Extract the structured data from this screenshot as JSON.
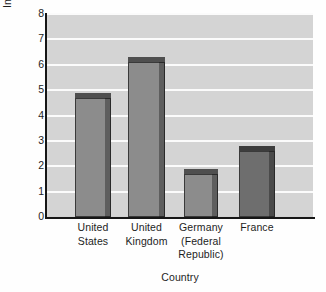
{
  "chart_data": {
    "type": "bar",
    "title": "",
    "xlabel": "Country",
    "ylabel": "Investment Growth Rate (%)",
    "categories": [
      "United States",
      "United Kingdom",
      "Germany (Federal Republic)",
      "France"
    ],
    "category_lines": [
      [
        "United",
        "States"
      ],
      [
        "United",
        "Kingdom"
      ],
      [
        "Germany",
        "(Federal",
        "Republic)"
      ],
      [
        "France"
      ]
    ],
    "values": [
      4.9,
      6.3,
      1.9,
      2.8
    ],
    "ylim": [
      0,
      8
    ],
    "ytick_labels": [
      "0",
      "1",
      "2",
      "3",
      "4",
      "5",
      "6",
      "7",
      "8"
    ],
    "ytick_values": [
      0,
      1,
      2,
      3,
      4,
      5,
      6,
      7,
      8
    ],
    "ytick_step": 1,
    "grid": "horizontal",
    "legend": "none",
    "bar_colors": [
      "#8c8c8c",
      "#8c8c8c",
      "#8c8c8c",
      "#6e6e6e"
    ],
    "bar_side_colors": [
      "#5e5e5e",
      "#5e5e5e",
      "#5e5e5e",
      "#4a4a4a"
    ],
    "bar_top_colors": [
      "#4f4f4f",
      "#4f4f4f",
      "#4f4f4f",
      "#3d3d3d"
    ],
    "plot_background": "#d4d4d4",
    "gridline_color": "#fbfbfb",
    "axis_color": "#161616",
    "text_color": "#1d1d1d"
  }
}
